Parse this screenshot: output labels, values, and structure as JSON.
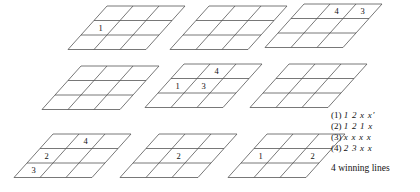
{
  "figure": {
    "kind": "tic-tac-toe-board-series",
    "board_rows": 3,
    "board_cols": 3,
    "line_color": "#555555",
    "text_color": "#111111",
    "background": "#ffffff",
    "boards": [
      {
        "id": "board-1",
        "position": "top-left",
        "x": 68,
        "y": 6,
        "marks": [
          {
            "row": 1,
            "col": 0,
            "value": "1"
          }
        ]
      },
      {
        "id": "board-2",
        "position": "top-center",
        "x": 170,
        "y": 6,
        "marks": []
      },
      {
        "id": "board-3",
        "position": "top-right",
        "x": 265,
        "y": 4,
        "marks": [
          {
            "row": 0,
            "col": 1,
            "value": "4"
          },
          {
            "row": 0,
            "col": 2,
            "value": "3"
          }
        ]
      },
      {
        "id": "board-4",
        "position": "middle-left",
        "x": 42,
        "y": 66,
        "marks": []
      },
      {
        "id": "board-5",
        "position": "middle-center",
        "x": 145,
        "y": 64,
        "marks": [
          {
            "row": 0,
            "col": 1,
            "value": "4"
          },
          {
            "row": 1,
            "col": 0,
            "value": "1"
          },
          {
            "row": 1,
            "col": 1,
            "value": "3"
          }
        ]
      },
      {
        "id": "board-6",
        "position": "middle-right",
        "x": 250,
        "y": 64,
        "marks": []
      },
      {
        "id": "board-7",
        "position": "bottom-left",
        "x": 14,
        "y": 134,
        "marks": [
          {
            "row": 0,
            "col": 1,
            "value": "4"
          },
          {
            "row": 1,
            "col": 0,
            "value": "2"
          },
          {
            "row": 2,
            "col": 0,
            "value": "3"
          }
        ]
      },
      {
        "id": "board-8",
        "position": "bottom-center",
        "x": 120,
        "y": 134,
        "marks": [
          {
            "row": 1,
            "col": 1,
            "value": "2"
          }
        ]
      },
      {
        "id": "board-9",
        "position": "bottom-right",
        "x": 228,
        "y": 134,
        "marks": [
          {
            "row": 1,
            "col": 0,
            "value": "1"
          },
          {
            "row": 1,
            "col": 2,
            "value": "2"
          }
        ]
      }
    ]
  },
  "legend": {
    "lines": [
      {
        "tag": "(1)",
        "seq": "1 2 x x′"
      },
      {
        "tag": "(2)",
        "seq": "1 2 1 x"
      },
      {
        "tag": "(3)",
        "seq": "x x x x"
      },
      {
        "tag": "(4)",
        "seq": "2 3 x x"
      }
    ],
    "footer": "4 winning lines"
  }
}
